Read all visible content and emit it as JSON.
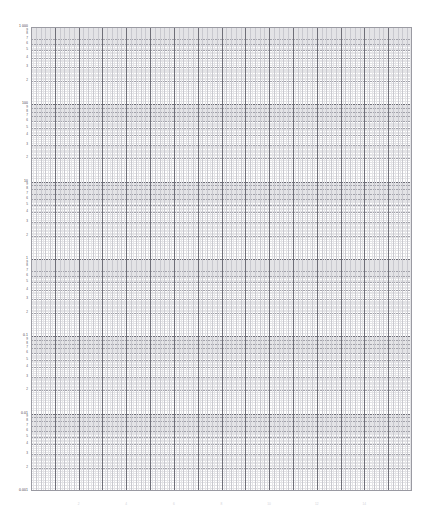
{
  "document": {
    "kind": "semi-logarithmic graph paper",
    "background_color": "#ffffff"
  },
  "plot": {
    "left": 31,
    "top": 27,
    "width": 381,
    "height": 464,
    "frame_color": "#9a9aa2",
    "grid": {
      "minor_color": "#e3e3e6",
      "mid_color": "#c9c9cf",
      "major_color": "#a3a3ab",
      "decade_color": "#6f6f78"
    }
  },
  "chart_data": {
    "type": "line",
    "title": "",
    "subtitle": "",
    "xlabel": "",
    "ylabel": "",
    "grid": true,
    "legend": null,
    "series": [],
    "x_axis": {
      "scale": "linear",
      "range": [
        0,
        16
      ],
      "major_divisions": 16,
      "minor_per_major": 5,
      "tick_labels": [
        "2",
        "4",
        "6",
        "8",
        "10",
        "12",
        "14"
      ],
      "tick_values": [
        2,
        4,
        6,
        8,
        10,
        12,
        14
      ]
    },
    "y_axis": {
      "scale": "log",
      "range": [
        0.001,
        1000
      ],
      "decades": 6,
      "decade_labels": [
        "1 000",
        "100",
        "10",
        "1",
        "0.1",
        "0.01",
        "0.001"
      ],
      "decade_values": [
        1000,
        100,
        10,
        1,
        0.1,
        0.01,
        0.001
      ],
      "minor_labels": [
        "9",
        "8",
        "7",
        "6",
        "5",
        "4",
        "3",
        "2"
      ],
      "minor_mantissas": [
        9,
        8,
        7,
        6,
        5,
        4,
        3,
        2
      ],
      "labeled_ticks": [
        {
          "value": 1000,
          "text": "1 000"
        },
        {
          "value": 100,
          "text": "100"
        },
        {
          "value": 10,
          "text": "10"
        },
        {
          "value": 9,
          "text": "9"
        },
        {
          "value": 8,
          "text": "8"
        },
        {
          "value": 7,
          "text": "7"
        },
        {
          "value": 6,
          "text": "6"
        },
        {
          "value": 5,
          "text": "5"
        },
        {
          "value": 4,
          "text": "4"
        },
        {
          "value": 3,
          "text": "3"
        },
        {
          "value": 2,
          "text": "2"
        },
        {
          "value": 1,
          "text": "1"
        },
        {
          "value": 0.1,
          "text": "0.1"
        },
        {
          "value": 0.01,
          "text": "0.01"
        },
        {
          "value": 0.001,
          "text": "0.001"
        }
      ]
    }
  }
}
